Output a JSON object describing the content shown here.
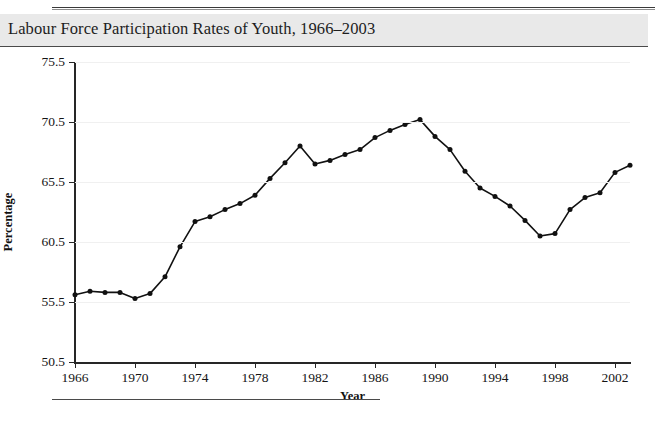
{
  "figure": {
    "title": "Labour Force Participation Rates of Youth, 1966–2003",
    "axis_title_x": "Year",
    "axis_title_y": "Percentage"
  },
  "chart_data": {
    "type": "line",
    "title": "Labour Force Participation Rates of Youth, 1966–2003",
    "xlabel": "Year",
    "ylabel": "Percentage",
    "xlim": [
      1966,
      2003
    ],
    "ylim": [
      50.5,
      75.5
    ],
    "xticks": [
      1966,
      1970,
      1974,
      1978,
      1982,
      1986,
      1990,
      1994,
      1998,
      2002
    ],
    "xtick_labels": [
      "1966",
      "1970",
      "1974",
      "1978",
      "1982",
      "1986",
      "1990",
      "1994",
      "1998",
      "2002"
    ],
    "yticks": [
      50.5,
      55.5,
      60.5,
      65.5,
      70.5,
      75.5
    ],
    "ytick_labels": [
      "50.5",
      "55.5",
      "60.5",
      "65.5",
      "70.5",
      "75.5"
    ],
    "grid": "horizontal",
    "legend": "none",
    "marker": "filled-circle",
    "line_color": "#111111",
    "x": [
      1966,
      1967,
      1968,
      1969,
      1970,
      1971,
      1972,
      1973,
      1974,
      1975,
      1976,
      1977,
      1978,
      1979,
      1980,
      1981,
      1982,
      1983,
      1984,
      1985,
      1986,
      1987,
      1988,
      1989,
      1990,
      1991,
      1992,
      1993,
      1994,
      1995,
      1996,
      1997,
      1998,
      1999,
      2000,
      2001,
      2002,
      2003
    ],
    "values": [
      56.1,
      56.4,
      56.3,
      56.3,
      55.8,
      56.2,
      57.6,
      60.1,
      62.2,
      62.6,
      63.2,
      63.7,
      64.4,
      65.8,
      67.1,
      68.5,
      67.0,
      67.3,
      67.8,
      68.2,
      69.2,
      69.8,
      70.3,
      70.7,
      69.3,
      68.2,
      66.4,
      65.0,
      64.3,
      63.5,
      62.3,
      61.0,
      61.2,
      63.2,
      64.2,
      64.6,
      66.3,
      66.9
    ]
  }
}
